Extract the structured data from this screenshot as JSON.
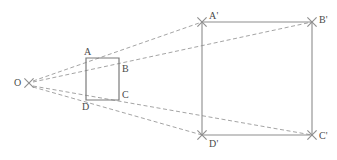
{
  "figure": {
    "background_color": "#ffffff",
    "stroke_color": "#8d8d8d",
    "solid_stroke_color": "#7b7b7b",
    "dashed_stroke_color": "#9a9a9a",
    "label_color": "#4a4a4a",
    "canvas": {
      "width": 337,
      "height": 160
    }
  },
  "points": {
    "O": {
      "label": "O",
      "x": 29,
      "y": 83,
      "marker": "x-cross",
      "label_x": 14,
      "label_y": 78
    },
    "A": {
      "label": "A",
      "x": 86,
      "y": 58,
      "marker": "none",
      "label_x": 84,
      "label_y": 47
    },
    "B": {
      "label": "B",
      "x": 119,
      "y": 70,
      "marker": "none",
      "label_x": 122,
      "label_y": 64
    },
    "C": {
      "label": "C",
      "x": 119,
      "y": 96,
      "marker": "none",
      "label_x": 122,
      "label_y": 90
    },
    "D": {
      "label": "D",
      "x": 86,
      "y": 101,
      "marker": "none",
      "label_x": 82,
      "label_y": 102
    },
    "Ap": {
      "label": "A'",
      "x": 202,
      "y": 22,
      "marker": "x-cross",
      "label_x": 209,
      "label_y": 11
    },
    "Bp": {
      "label": "B'",
      "x": 312,
      "y": 22,
      "marker": "x-cross",
      "label_x": 319,
      "label_y": 15
    },
    "Cp": {
      "label": "C'",
      "x": 312,
      "y": 135,
      "marker": "x-cross",
      "label_x": 319,
      "label_y": 131
    },
    "Dp": {
      "label": "D'",
      "x": 202,
      "y": 135,
      "marker": "x-cross",
      "label_x": 209,
      "label_y": 139
    }
  },
  "shapes": {
    "small_square": {
      "name": "square-ABCD",
      "style": "solid",
      "vertices": [
        [
          86,
          58
        ],
        [
          119,
          58
        ],
        [
          119,
          100
        ],
        [
          86,
          100
        ]
      ]
    },
    "large_rectangle": {
      "name": "rectangle-A'B'C'D'",
      "style": "solid",
      "vertices": [
        [
          202,
          22
        ],
        [
          312,
          22
        ],
        [
          312,
          135
        ],
        [
          202,
          135
        ]
      ]
    }
  },
  "projection_rays": [
    {
      "name": "ray-O-A-to-A-prime",
      "from": "O",
      "through": "A",
      "to": "Ap",
      "x1": 33,
      "y1": 81,
      "x2": 202,
      "y2": 22,
      "style": "dashed"
    },
    {
      "name": "ray-O-B-to-B-prime",
      "from": "O",
      "through": "B",
      "to": "Bp",
      "x1": 33,
      "y1": 82,
      "x2": 312,
      "y2": 22,
      "style": "dashed"
    },
    {
      "name": "ray-O-C-to-C-prime",
      "from": "O",
      "through": "C",
      "to": "Cp",
      "x1": 33,
      "y1": 86,
      "x2": 312,
      "y2": 135,
      "style": "dashed"
    },
    {
      "name": "ray-O-D-to-D-prime",
      "from": "O",
      "through": "D",
      "to": "Dp",
      "x1": 33,
      "y1": 87,
      "x2": 202,
      "y2": 135,
      "style": "dashed"
    }
  ],
  "labels": {
    "O": "O",
    "A": "A",
    "B": "B",
    "C": "C",
    "D": "D",
    "Ap": "A'",
    "Bp": "B'",
    "Cp": "C'",
    "Dp": "D'"
  }
}
